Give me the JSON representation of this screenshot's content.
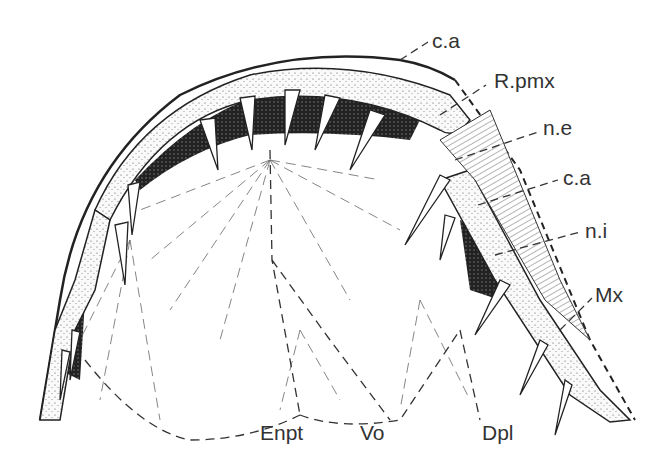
{
  "figure": {
    "labels": [
      {
        "id": "ca_top",
        "text": "c.a",
        "x": 432,
        "y": 30
      },
      {
        "id": "rpmx",
        "text": "R.pmx",
        "x": 494,
        "y": 70
      },
      {
        "id": "ne",
        "text": "n.e",
        "x": 543,
        "y": 117
      },
      {
        "id": "ca_mid",
        "text": "c.a",
        "x": 563,
        "y": 167
      },
      {
        "id": "ni",
        "text": "n.i",
        "x": 585,
        "y": 220
      },
      {
        "id": "mx",
        "text": "Mx",
        "x": 595,
        "y": 284
      },
      {
        "id": "enpt",
        "text": "Enpt",
        "x": 260,
        "y": 422
      },
      {
        "id": "vo",
        "text": "Vo",
        "x": 360,
        "y": 422
      },
      {
        "id": "dpl",
        "text": "Dpl",
        "x": 482,
        "y": 422
      }
    ],
    "colors": {
      "ink": "#222222",
      "label": "#333333",
      "background": "#ffffff"
    }
  }
}
